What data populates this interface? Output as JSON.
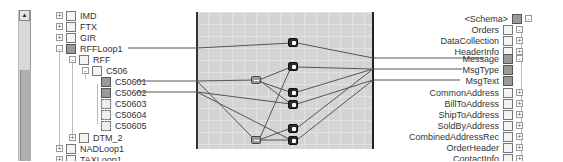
{
  "source_tree": {
    "items": [
      {
        "label": "IMD",
        "expander": "+",
        "icon": "segment-icon"
      },
      {
        "label": "FTX",
        "expander": "+",
        "icon": "segment-icon"
      },
      {
        "label": "GIR",
        "expander": "+",
        "icon": "segment-icon"
      },
      {
        "label": "RFFLoop1",
        "expander": "-",
        "icon": "loop-icon"
      },
      {
        "label": "RFF",
        "expander": "-",
        "icon": "segment-icon"
      },
      {
        "label": "C506",
        "expander": "-",
        "icon": "segment-icon"
      },
      {
        "label": "C50601",
        "icon": "linked-field-icon"
      },
      {
        "label": "C50602",
        "icon": "linked-field-icon"
      },
      {
        "label": "C50603",
        "icon": "field-icon"
      },
      {
        "label": "C50604",
        "icon": "field-icon"
      },
      {
        "label": "C50605",
        "icon": "field-icon"
      },
      {
        "label": "DTM_2",
        "expander": "+",
        "icon": "segment-icon"
      },
      {
        "label": "NADLoop1",
        "expander": "+",
        "icon": "segment-icon"
      },
      {
        "label": "TAXLoop1",
        "expander": "+",
        "icon": "segment-icon"
      }
    ]
  },
  "target_tree": {
    "items": [
      {
        "label": "<Schema>",
        "expander": "-",
        "icon": "schema-icon"
      },
      {
        "label": "Orders",
        "expander": "-",
        "icon": "record-icon"
      },
      {
        "label": "DataCollection",
        "expander": "+",
        "icon": "record-icon"
      },
      {
        "label": "HeaderInfo",
        "expander": "+",
        "icon": "record-icon"
      },
      {
        "label": "Message",
        "expander": "-",
        "icon": "linked-record-icon"
      },
      {
        "label": "MsgType",
        "icon": "linked-field-icon"
      },
      {
        "label": "MsgText",
        "icon": "linked-field-icon"
      },
      {
        "label": "CommonAddress",
        "expander": "+",
        "icon": "record-icon"
      },
      {
        "label": "BillToAddress",
        "expander": "+",
        "icon": "record-icon"
      },
      {
        "label": "ShipToAddress",
        "expander": "+",
        "icon": "record-icon"
      },
      {
        "label": "SoldByAddress",
        "expander": "+",
        "icon": "record-icon"
      },
      {
        "label": "CombinedAddressRec",
        "expander": "+",
        "icon": "record-icon"
      },
      {
        "label": "OrderHeader",
        "expander": "+",
        "icon": "record-icon"
      },
      {
        "label": "ContactInfo",
        "expander": "+",
        "icon": "record-icon"
      }
    ]
  },
  "functoids": [
    {
      "name": "looping-functoid",
      "type": "dark"
    },
    {
      "name": "value-mapping-functoid",
      "type": "dark"
    },
    {
      "name": "equal-functoid-1",
      "type": "light"
    },
    {
      "name": "value-mapping-functoid-1",
      "type": "dark"
    },
    {
      "name": "value-mapping-functoid-2",
      "type": "dark"
    },
    {
      "name": "value-mapping-functoid-3",
      "type": "dark"
    },
    {
      "name": "value-mapping-functoid-4",
      "type": "dark"
    },
    {
      "name": "equal-functoid-2",
      "type": "light"
    }
  ],
  "colors": {
    "grid_bg": "#d4d4d4",
    "link": "#555555"
  }
}
